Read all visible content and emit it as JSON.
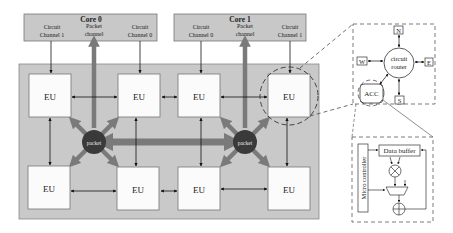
{
  "cores": [
    {
      "title": "Core 0",
      "labels": {
        "left": [
          "Circuit",
          "Channel 1"
        ],
        "middle": [
          "Packet",
          "channel"
        ],
        "right": [
          "Circuit",
          "Channel 0"
        ]
      }
    },
    {
      "title": "Core 1",
      "labels": {
        "left": [
          "Circuit",
          "Channel 0"
        ],
        "middle": [
          "Packet",
          "channel"
        ],
        "right": [
          "Circuit",
          "Channel 1"
        ]
      }
    }
  ],
  "eu_label": "EU",
  "packet_label": "packet",
  "router": {
    "center": [
      "circuit",
      "router"
    ],
    "ports": {
      "north": "N",
      "south": "S",
      "west": "W",
      "east": "E"
    },
    "acc": "ACC"
  },
  "accelerator": {
    "controller": "Micro controller",
    "buffer": "Data buffer"
  },
  "colors": {
    "core_bg": "#c8c8c8",
    "array_bg": "#c9c9c9",
    "eu_bg": "#fbfbfb",
    "packet_node": "#3a3a3a",
    "packet_arrow": "#7a7a7a",
    "wire": "#111111"
  }
}
